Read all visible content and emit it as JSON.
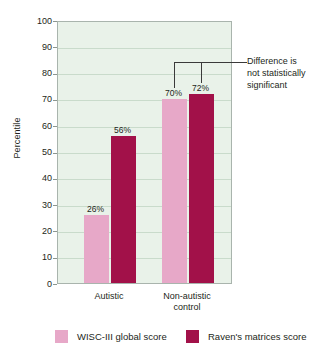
{
  "chart_data": {
    "type": "bar",
    "title": "",
    "subtitle": "",
    "xlabel": "",
    "ylabel": "Percentile",
    "ylim": [
      0,
      100
    ],
    "ytick_values": [
      0,
      10,
      20,
      30,
      40,
      50,
      60,
      70,
      80,
      90,
      100
    ],
    "ytick_labels": [
      "0",
      "10",
      "20",
      "30",
      "40",
      "50",
      "60",
      "70",
      "80",
      "90",
      "100"
    ],
    "grid": true,
    "legend_position": "bottom",
    "categories": [
      "Autistic",
      "Non-autistic control"
    ],
    "category_labels": [
      [
        "Autistic"
      ],
      [
        "Non-autistic",
        "control"
      ]
    ],
    "series": [
      {
        "name": "WISC-III global score",
        "color": "#e7a8c8",
        "values": [
          26,
          70
        ],
        "value_labels": [
          "26%",
          "70%"
        ]
      },
      {
        "name": "Raven's matrices score",
        "color": "#a21149",
        "values": [
          56,
          72
        ],
        "value_labels": [
          "56%",
          "72%"
        ]
      }
    ],
    "annotations": [
      {
        "id": "significance-note",
        "lines": [
          "Difference is",
          "not statistically",
          "significant"
        ],
        "target_group": "Non-autistic control",
        "bracket_over": [
          "WISC-III global score",
          "Raven's matrices score"
        ]
      }
    ]
  },
  "colors": {
    "plot_background": "#e9f2e9",
    "plot_border": "#a9b4ad",
    "gridline": "#c9dbcb",
    "wisc": "#e7a8c8",
    "raven": "#a21149",
    "text": "#231f20",
    "annotation_line": "#3a3a3a"
  },
  "legend": {
    "items": [
      {
        "label": "WISC-III global score",
        "swatch": "wisc"
      },
      {
        "label": "Raven's matrices score",
        "swatch": "raven"
      }
    ]
  }
}
